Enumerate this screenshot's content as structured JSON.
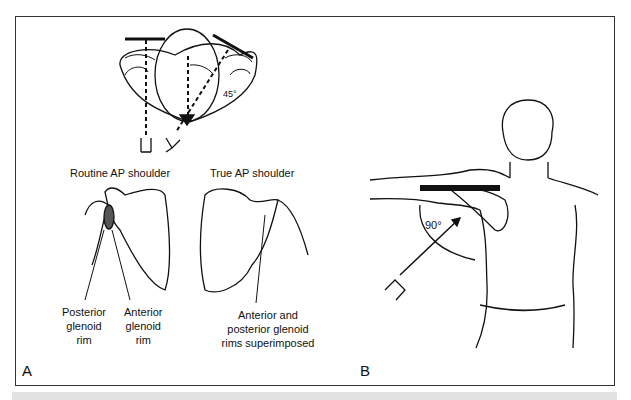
{
  "figure": {
    "panel_a": {
      "letter": "A",
      "angle_label": "45°",
      "view_titles": [
        "Routine AP shoulder",
        "True AP shoulder"
      ],
      "routine_labels": {
        "posterior": [
          "Posterior",
          "glenoid",
          "rim"
        ],
        "anterior": [
          "Anterior",
          "glenoid",
          "rim"
        ]
      },
      "true_label": [
        "Anterior and",
        "posterior glenoid",
        "rims superimposed"
      ]
    },
    "panel_b": {
      "letter": "B",
      "angle_label": "90°"
    }
  }
}
